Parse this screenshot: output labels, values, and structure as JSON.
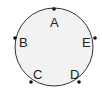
{
  "diagram": {
    "type": "circle-with-points",
    "circle": {
      "cx": 54,
      "cy": 47,
      "r": 39,
      "fill": "#f2f2f2",
      "stroke": "#333333"
    },
    "points": [
      {
        "label": "A",
        "x": 54,
        "y": 9,
        "lx": 50,
        "ly": 27
      },
      {
        "label": "B",
        "x": 15,
        "y": 38,
        "lx": 19,
        "ly": 47
      },
      {
        "label": "C",
        "x": 31,
        "y": 82,
        "lx": 33,
        "ly": 79
      },
      {
        "label": "D",
        "x": 79,
        "y": 82,
        "lx": 70,
        "ly": 79
      },
      {
        "label": "E",
        "x": 95,
        "y": 38,
        "lx": 82,
        "ly": 47
      }
    ]
  }
}
